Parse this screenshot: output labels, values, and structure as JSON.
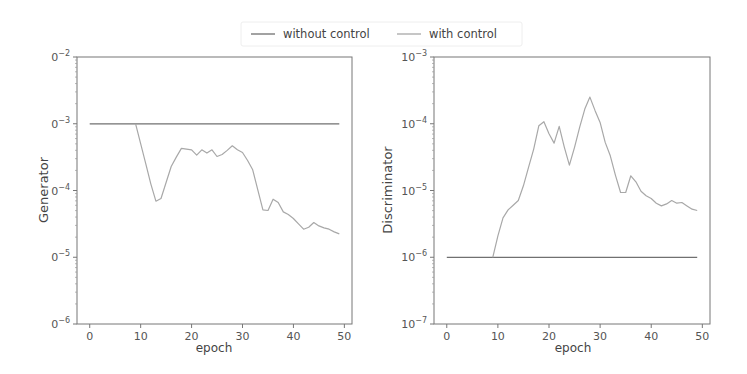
{
  "legend": {
    "items": [
      {
        "label": "without control",
        "color": "#707070"
      },
      {
        "label": "with control",
        "color": "#a8a8a8"
      }
    ]
  },
  "chart_data": [
    {
      "type": "line",
      "title": "",
      "xlabel": "epoch",
      "ylabel": "Generator",
      "yscale": "log",
      "xlim": [
        -2.5,
        51.5
      ],
      "ylim_log10": [
        -6,
        -2
      ],
      "xticks": [
        0,
        10,
        20,
        30,
        40,
        50
      ],
      "xtick_labels": [
        "0",
        "10",
        "20",
        "30",
        "40",
        "50"
      ],
      "yticks_log10": [
        -6,
        -5,
        -4,
        -3,
        -2
      ],
      "ytick_labels": [
        {
          "base": "0",
          "exp": "−6"
        },
        {
          "base": "0",
          "exp": "−5"
        },
        {
          "base": "0",
          "exp": "−4"
        },
        {
          "base": "0",
          "exp": "−3"
        },
        {
          "base": "0",
          "exp": "−2"
        }
      ],
      "series": [
        {
          "name": "without control",
          "x": [
            0,
            49
          ],
          "log10_values": [
            -3.0,
            -3.0
          ]
        },
        {
          "name": "with control",
          "x": [
            9,
            10,
            11,
            12,
            13,
            14,
            15,
            16,
            17,
            18,
            19,
            20,
            21,
            22,
            23,
            24,
            25,
            26,
            27,
            28,
            29,
            30,
            31,
            32,
            33,
            34,
            35,
            36,
            37,
            38,
            39,
            40,
            41,
            42,
            43,
            44,
            45,
            46,
            47,
            48,
            49
          ],
          "log10_values": [
            -3.0,
            -3.3,
            -3.6,
            -3.9,
            -4.16,
            -4.12,
            -3.88,
            -3.64,
            -3.5,
            -3.37,
            -3.38,
            -3.39,
            -3.47,
            -3.39,
            -3.44,
            -3.39,
            -3.49,
            -3.46,
            -3.4,
            -3.33,
            -3.39,
            -3.43,
            -3.55,
            -3.69,
            -3.99,
            -4.29,
            -4.3,
            -4.13,
            -4.18,
            -4.32,
            -4.36,
            -4.42,
            -4.5,
            -4.58,
            -4.55,
            -4.48,
            -4.53,
            -4.56,
            -4.58,
            -4.62,
            -4.65
          ]
        }
      ]
    },
    {
      "type": "line",
      "title": "",
      "xlabel": "epoch",
      "ylabel": "Discriminator",
      "yscale": "log",
      "xlim": [
        -2.5,
        51.5
      ],
      "ylim_log10": [
        -7,
        -3
      ],
      "xticks": [
        0,
        10,
        20,
        30,
        40,
        50
      ],
      "xtick_labels": [
        "0",
        "10",
        "20",
        "30",
        "40",
        "50"
      ],
      "yticks_log10": [
        -7,
        -6,
        -5,
        -4,
        -3
      ],
      "ytick_labels": [
        {
          "base": "10",
          "exp": "−7"
        },
        {
          "base": "10",
          "exp": "−6"
        },
        {
          "base": "10",
          "exp": "−5"
        },
        {
          "base": "10",
          "exp": "−4"
        },
        {
          "base": "10",
          "exp": "−3"
        }
      ],
      "series": [
        {
          "name": "without control",
          "x": [
            0,
            49
          ],
          "log10_values": [
            -6.0,
            -6.0
          ]
        },
        {
          "name": "with control",
          "x": [
            9,
            10,
            11,
            12,
            13,
            14,
            15,
            16,
            17,
            18,
            19,
            20,
            21,
            22,
            23,
            24,
            25,
            26,
            27,
            28,
            29,
            30,
            31,
            32,
            33,
            34,
            35,
            36,
            37,
            38,
            39,
            40,
            41,
            42,
            43,
            44,
            45,
            46,
            47,
            48,
            49
          ],
          "log10_values": [
            -6.0,
            -5.68,
            -5.41,
            -5.29,
            -5.22,
            -5.15,
            -4.93,
            -4.65,
            -4.38,
            -4.03,
            -3.97,
            -4.15,
            -4.29,
            -4.04,
            -4.35,
            -4.62,
            -4.35,
            -4.05,
            -3.78,
            -3.6,
            -3.8,
            -3.98,
            -4.28,
            -4.48,
            -4.77,
            -5.03,
            -5.03,
            -4.78,
            -4.87,
            -5.01,
            -5.08,
            -5.12,
            -5.19,
            -5.23,
            -5.2,
            -5.15,
            -5.19,
            -5.18,
            -5.23,
            -5.28,
            -5.3
          ]
        }
      ]
    }
  ]
}
